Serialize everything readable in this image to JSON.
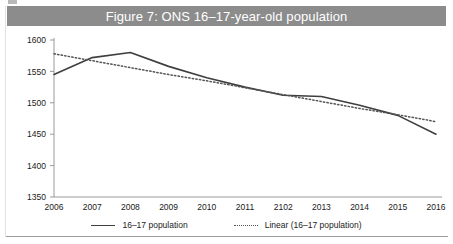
{
  "figure": {
    "title": "Figure 7: ONS 16–17-year-old population",
    "title_bar_color": "#8c8c8c",
    "title_text_color": "#ffffff",
    "background_color": "#ffffff"
  },
  "legend": {
    "position": "bottom-center",
    "entries": [
      {
        "label": "16–17 population",
        "style": "solid",
        "color": "#3f3f3f"
      },
      {
        "label": "Linear (16–17 population)",
        "style": "dotted",
        "color": "#555555"
      }
    ]
  },
  "axis": {
    "y_ticks": [
      "1600",
      "1550",
      "1500",
      "1450",
      "1400",
      "1350"
    ],
    "x_ticks": [
      "2006",
      "2007",
      "2008",
      "2009",
      "2010",
      "2011",
      "2102",
      "2013",
      "2014",
      "2015",
      "2016"
    ]
  },
  "chart_data": {
    "type": "line",
    "title": "Figure 7: ONS 16–17-year-old population",
    "xlabel": "",
    "ylabel": "",
    "ylim": [
      1350,
      1600
    ],
    "ytick_step": 50,
    "grid": false,
    "legend_position": "bottom-center",
    "categories": [
      "2006",
      "2007",
      "2008",
      "2009",
      "2010",
      "2011",
      "2102",
      "2013",
      "2014",
      "2015",
      "2016"
    ],
    "series": [
      {
        "name": "16–17 population",
        "style": "solid",
        "color": "#3f3f3f",
        "values": [
          1545,
          1572,
          1580,
          1558,
          1540,
          1525,
          1512,
          1510,
          1496,
          1480,
          1450
        ]
      },
      {
        "name": "Linear (16–17 population)",
        "style": "dotted",
        "color": "#555555",
        "values": [
          1578,
          1567,
          1556,
          1545,
          1535,
          1524,
          1513,
          1502,
          1491,
          1481,
          1470
        ]
      }
    ]
  }
}
